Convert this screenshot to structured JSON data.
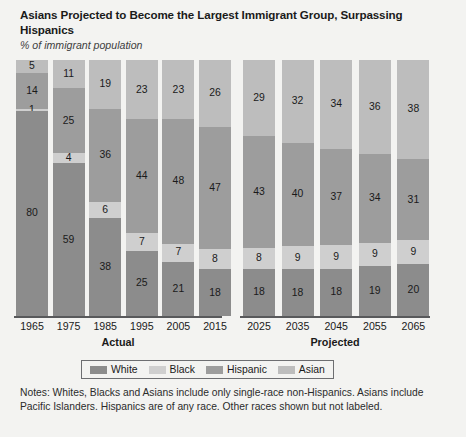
{
  "header": {
    "title": "Asians Projected to Become the Largest Immigrant Group, Surpassing Hispanics",
    "subtitle": "% of immigrant population"
  },
  "axis": {
    "group_actual_label": "Actual",
    "group_projected_label": "Projected"
  },
  "legend": {
    "items": [
      {
        "label": "White",
        "color": "#8c8c8c"
      },
      {
        "label": "Black",
        "color": "#cfcfcf"
      },
      {
        "label": "Hispanic",
        "color": "#9d9d9d"
      },
      {
        "label": "Asian",
        "color": "#bdbdbd"
      }
    ]
  },
  "notes": {
    "text": "Notes: Whites, Blacks and Asians include only single-race non-Hispanics. Asians include Pacific Islanders. Hispanics are of any race. Other races shown but not labeled."
  },
  "chart_data": {
    "type": "bar",
    "subtype": "stacked-100-percent",
    "title": "Asians Projected to Become the Largest Immigrant Group, Surpassing Hispanics",
    "subtitle": "% of immigrant population",
    "xlabel": "",
    "ylabel": "% of immigrant population",
    "ylim": [
      0,
      100
    ],
    "grid": false,
    "legend_position": "bottom",
    "stack_order_bottom_to_top": [
      "White",
      "Black",
      "Hispanic",
      "Asian"
    ],
    "categories": [
      "1965",
      "1975",
      "1985",
      "1995",
      "2005",
      "2015",
      "2025",
      "2035",
      "2045",
      "2055",
      "2065"
    ],
    "groups": [
      {
        "name": "Actual",
        "categories": [
          "1965",
          "1975",
          "1985",
          "1995",
          "2005",
          "2015"
        ]
      },
      {
        "name": "Projected",
        "categories": [
          "2025",
          "2035",
          "2045",
          "2055",
          "2065"
        ]
      }
    ],
    "series": [
      {
        "name": "White",
        "color": "#8c8c8c",
        "values": [
          80,
          59,
          38,
          25,
          21,
          18,
          18,
          18,
          18,
          19,
          20
        ]
      },
      {
        "name": "Black",
        "color": "#cfcfcf",
        "values": [
          1,
          4,
          6,
          7,
          7,
          8,
          8,
          9,
          9,
          9,
          9
        ]
      },
      {
        "name": "Hispanic",
        "color": "#9d9d9d",
        "values": [
          14,
          25,
          36,
          44,
          48,
          47,
          43,
          40,
          37,
          34,
          31
        ]
      },
      {
        "name": "Asian",
        "color": "#bdbdbd",
        "values": [
          5,
          11,
          19,
          23,
          23,
          26,
          29,
          32,
          34,
          36,
          38
        ]
      }
    ],
    "bars": [
      {
        "year": "1965",
        "group": "Actual",
        "White": 80,
        "Black": 1,
        "Hispanic": 14,
        "Asian": 5
      },
      {
        "year": "1975",
        "group": "Actual",
        "White": 59,
        "Black": 4,
        "Hispanic": 25,
        "Asian": 11
      },
      {
        "year": "1985",
        "group": "Actual",
        "White": 38,
        "Black": 6,
        "Hispanic": 36,
        "Asian": 19
      },
      {
        "year": "1995",
        "group": "Actual",
        "White": 25,
        "Black": 7,
        "Hispanic": 44,
        "Asian": 23
      },
      {
        "year": "2005",
        "group": "Actual",
        "White": 21,
        "Black": 7,
        "Hispanic": 48,
        "Asian": 23
      },
      {
        "year": "2015",
        "group": "Actual",
        "White": 18,
        "Black": 8,
        "Hispanic": 47,
        "Asian": 26
      },
      {
        "year": "2025",
        "group": "Projected",
        "White": 18,
        "Black": 8,
        "Hispanic": 43,
        "Asian": 29
      },
      {
        "year": "2035",
        "group": "Projected",
        "White": 18,
        "Black": 9,
        "Hispanic": 40,
        "Asian": 32
      },
      {
        "year": "2045",
        "group": "Projected",
        "White": 18,
        "Black": 9,
        "Hispanic": 37,
        "Asian": 34
      },
      {
        "year": "2055",
        "group": "Projected",
        "White": 19,
        "Black": 9,
        "Hispanic": 34,
        "Asian": 36
      },
      {
        "year": "2065",
        "group": "Projected",
        "White": 20,
        "Black": 9,
        "Hispanic": 31,
        "Asian": 38
      }
    ]
  }
}
